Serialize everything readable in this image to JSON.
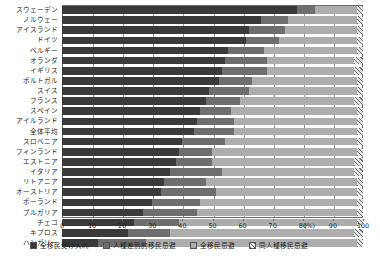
{
  "chart_data": {
    "type": "bar",
    "orientation": "horizontal",
    "stacked": true,
    "normalized": true,
    "title": "",
    "xlabel": "(%)",
    "ylabel": "",
    "xlim": [
      0,
      100
    ],
    "xticks": [
      0,
      10,
      20,
      30,
      40,
      50,
      60,
      70,
      80,
      90,
      100
    ],
    "xunit": "(%)",
    "grid": true,
    "legend_position": "bottom",
    "categories": [
      "スウェーデン",
      "ノルウェー",
      "アイスランド",
      "ドイツ",
      "ベルギー",
      "オランダ",
      "イギリス",
      "ポルトガル",
      "スイス",
      "フランス",
      "スペイン",
      "アイルランド",
      "全体平均",
      "スロベニア",
      "フィンランド",
      "エストニア",
      "イタリア",
      "リトアニア",
      "オーストリア",
      "ポーランド",
      "ブルガリア",
      "チェコ",
      "キプロス",
      "ハンガリー"
    ],
    "series": [
      {
        "name": "全移民受け入れ",
        "color": "#3a3a3a",
        "values": [
          78,
          66,
          62,
          61,
          55,
          54,
          53,
          52,
          49,
          48,
          46,
          45,
          44,
          40,
          39,
          38,
          36,
          34,
          33,
          30,
          27,
          24,
          22,
          12
        ]
      },
      {
        "name": "人種差別的移民忌避",
        "color": "#6e6e6e",
        "values": [
          6,
          9,
          12,
          11,
          12,
          14,
          15,
          11,
          13,
          11,
          10,
          12,
          13,
          14,
          11,
          12,
          17,
          14,
          18,
          16,
          18,
          15,
          14,
          16
        ]
      },
      {
        "name": "全移民忌避",
        "color": "#adadad",
        "values": [
          14,
          23,
          24,
          26,
          31,
          29,
          29,
          35,
          36,
          38,
          42,
          41,
          41,
          44,
          48,
          47,
          44,
          50,
          47,
          52,
          53,
          59,
          61,
          70
        ]
      },
      {
        "name": "同人種移民忌避",
        "color": "#e2e2e2",
        "pattern": "diagonal-hatch",
        "values": [
          2,
          2,
          2,
          2,
          2,
          3,
          3,
          2,
          2,
          3,
          2,
          2,
          2,
          2,
          2,
          3,
          3,
          2,
          2,
          2,
          2,
          2,
          3,
          2
        ]
      }
    ]
  },
  "legend": {
    "items": [
      {
        "label": "全移民受け入れ",
        "swatch": "s0"
      },
      {
        "label": "人種差別的移民忌避",
        "swatch": "s1"
      },
      {
        "label": "全移民忌避",
        "swatch": "s2"
      },
      {
        "label": "同人種移民忌避",
        "swatch": "s3"
      }
    ]
  }
}
